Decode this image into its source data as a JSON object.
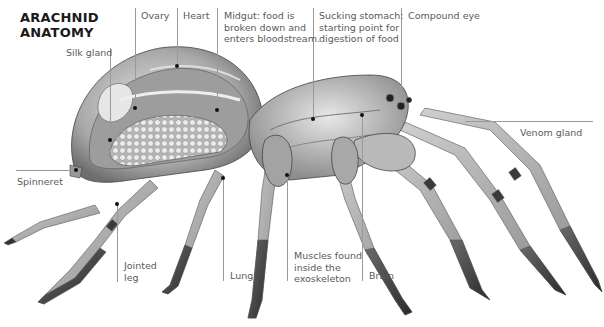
{
  "title": {
    "line1": "ARACHNID",
    "line2": "ANATOMY"
  },
  "labels": {
    "silk_gland": "Silk gland",
    "ovary": "Ovary",
    "heart": "Heart",
    "midgut": [
      "Midgut: food is",
      "broken down and",
      "enters bloodstream."
    ],
    "sucking_stomach": [
      "Sucking stomach:",
      "starting point for",
      "digestion of food"
    ],
    "compound_eye": "Compound eye",
    "venom_gland": "Venom gland",
    "spinneret": "Spinneret",
    "jointed_leg": [
      "Jointed",
      "leg"
    ],
    "lung": "Lung",
    "muscles": [
      "Muscles found",
      "inside the",
      "exoskeleton"
    ],
    "brain": "Brain"
  },
  "colors": {
    "title": "#1a1a1a",
    "label": "#5a5a5a",
    "leader": "#9a9a9a",
    "background": "#ffffff"
  }
}
